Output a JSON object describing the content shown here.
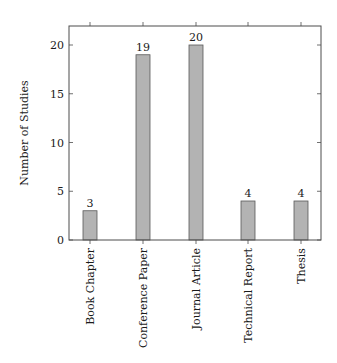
{
  "chart_data": {
    "type": "bar",
    "title": "",
    "xlabel": "",
    "ylabel": "Number of Studies",
    "categories": [
      "Book Chapter",
      "Conference Paper",
      "Journal Article",
      "Technical Report",
      "Thesis"
    ],
    "values": [
      3,
      19,
      20,
      4,
      4
    ],
    "ylim": [
      0,
      21.5
    ],
    "yticks": [
      0,
      5,
      10,
      15,
      20
    ],
    "grid": false,
    "legend": null,
    "bar_fill": "#b3b3b3",
    "bar_stroke": "#595959",
    "data_labels": true
  }
}
